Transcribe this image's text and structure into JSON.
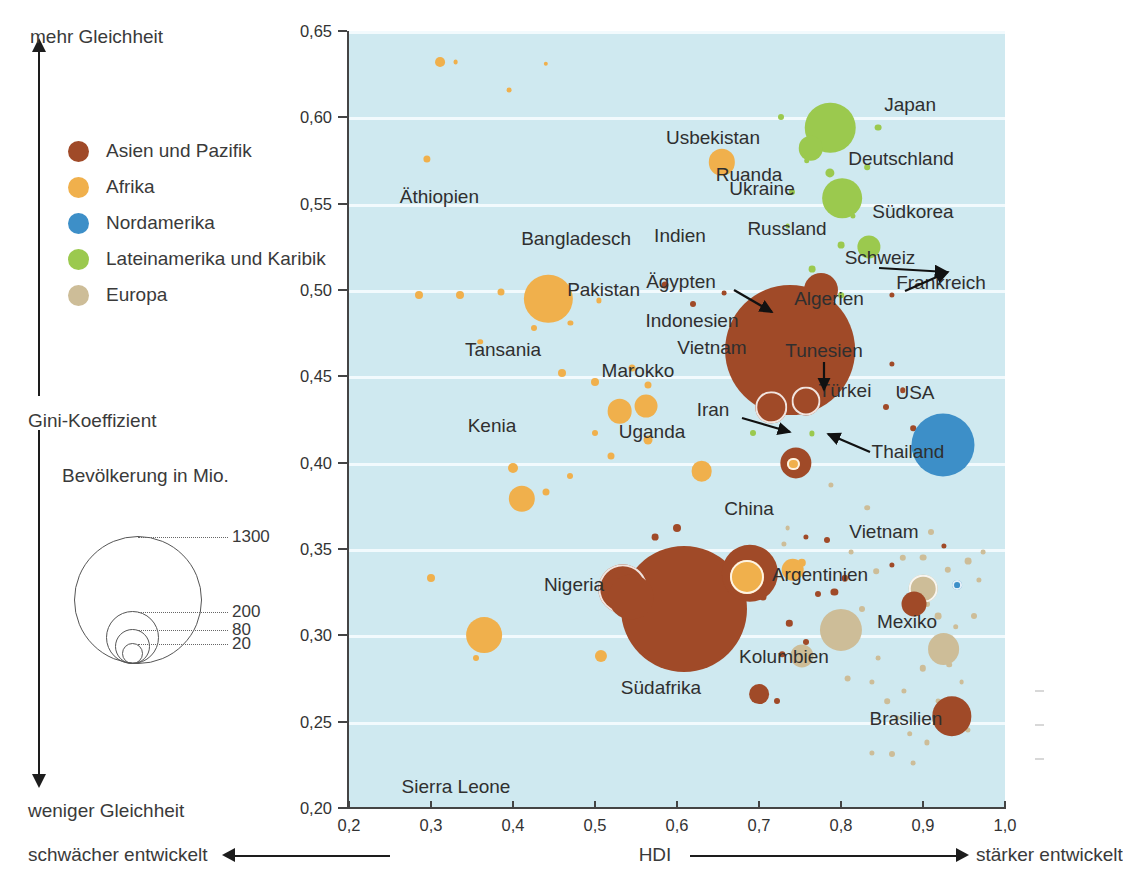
{
  "chart_data": {
    "type": "scatter",
    "subtype": "bubble",
    "title": "",
    "xlabel": "HDI",
    "ylabel": "Gini-Koeffizient",
    "xlim": [
      0.2,
      1.0
    ],
    "ylim": [
      0.65,
      0.2
    ],
    "y_inverted": true,
    "grid": "horizontal",
    "xticks": [
      "0,2",
      "0,3",
      "0,4",
      "0,5",
      "0,6",
      "0,7",
      "0,8",
      "0,9",
      "1,0"
    ],
    "xtick_values": [
      0.2,
      0.3,
      0.4,
      0.5,
      0.6,
      0.7,
      0.8,
      0.9,
      1.0
    ],
    "yticks": [
      "0,20",
      "0,25",
      "0,30",
      "0,35",
      "0,40",
      "0,45",
      "0,50",
      "0,55",
      "0,60",
      "0,65"
    ],
    "ytick_values": [
      0.2,
      0.25,
      0.3,
      0.35,
      0.4,
      0.45,
      0.5,
      0.55,
      0.6,
      0.65
    ],
    "size_encoding": "Bevölkerung in Mio.",
    "legend_position": "left",
    "plot_background": "#cfe9f0",
    "series": [
      {
        "name": "Asien und Pazifik",
        "color": "#a04a28"
      },
      {
        "name": "Afrika",
        "color": "#f0b04c"
      },
      {
        "name": "Nordamerika",
        "color": "#3d8fc8"
      },
      {
        "name": "Lateinamerika und Karibik",
        "color": "#9bc94e"
      },
      {
        "name": "Europa",
        "color": "#cdbd98"
      }
    ],
    "points": [
      {
        "name": "Indien",
        "group": 0,
        "hdi": 0.609,
        "gini": 0.315,
        "pop": 1300
      },
      {
        "name": "China",
        "group": 0,
        "hdi": 0.738,
        "gini": 0.465,
        "pop": 1380
      },
      {
        "name": "Bangladesch",
        "group": 0,
        "hdi": 0.544,
        "gini": 0.322,
        "pop": 165
      },
      {
        "name": "Pakistan",
        "group": 0,
        "hdi": 0.534,
        "gini": 0.327,
        "pop": 200
      },
      {
        "name": "Indonesien",
        "group": 0,
        "hdi": 0.689,
        "gini": 0.336,
        "pop": 260
      },
      {
        "name": "Japan",
        "group": 0,
        "hdi": 0.935,
        "gini": 0.253,
        "pop": 127
      },
      {
        "name": "Vietnam",
        "group": 0,
        "hdi": 0.775,
        "gini": 0.5,
        "pop": 95
      },
      {
        "name": "Ägypten",
        "group": 1,
        "hdi": 0.685,
        "gini": 0.334,
        "pop": 95
      },
      {
        "name": "Usbekistan",
        "group": 0,
        "hdi": 0.7,
        "gini": 0.266,
        "pop": 32
      },
      {
        "name": "Russland",
        "group": 4,
        "hdi": 0.8,
        "gini": 0.303,
        "pop": 145
      },
      {
        "name": "Ukraine",
        "group": 4,
        "hdi": 0.752,
        "gini": 0.288,
        "pop": 44
      },
      {
        "name": "Deutschland",
        "group": 4,
        "hdi": 0.925,
        "gini": 0.292,
        "pop": 83
      },
      {
        "name": "Südkorea",
        "group": 0,
        "hdi": 0.889,
        "gini": 0.318,
        "pop": 51
      },
      {
        "name": "Schweiz",
        "group": 2,
        "hdi": 0.942,
        "gini": 0.329,
        "pop": 8
      },
      {
        "name": "Frankreich",
        "group": 4,
        "hdi": 0.9,
        "gini": 0.327,
        "pop": 67
      },
      {
        "name": "Algerien",
        "group": 1,
        "hdi": 0.741,
        "gini": 0.338,
        "pop": 42
      },
      {
        "name": "Tunesien",
        "group": 1,
        "hdi": 0.742,
        "gini": 0.399,
        "pop": 12
      },
      {
        "name": "Türkei",
        "group": 0,
        "hdi": 0.745,
        "gini": 0.4,
        "pop": 80
      },
      {
        "name": "USA",
        "group": 2,
        "hdi": 0.924,
        "gini": 0.41,
        "pop": 325
      },
      {
        "name": "Iran",
        "group": 0,
        "hdi": 0.715,
        "gini": 0.432,
        "pop": 81
      },
      {
        "name": "Thailand",
        "group": 0,
        "hdi": 0.757,
        "gini": 0.436,
        "pop": 69
      },
      {
        "name": "Äthiopien",
        "group": 1,
        "hdi": 0.365,
        "gini": 0.3,
        "pop": 105
      },
      {
        "name": "Ruanda",
        "group": 1,
        "hdi": 0.507,
        "gini": 0.288,
        "pop": 12
      },
      {
        "name": "Tansania",
        "group": 1,
        "hdi": 0.411,
        "gini": 0.379,
        "pop": 57
      },
      {
        "name": "Marokko",
        "group": 1,
        "hdi": 0.63,
        "gini": 0.395,
        "pop": 35
      },
      {
        "name": "Kenia",
        "group": 1,
        "hdi": 0.53,
        "gini": 0.43,
        "pop": 50
      },
      {
        "name": "Uganda",
        "group": 1,
        "hdi": 0.562,
        "gini": 0.433,
        "pop": 43
      },
      {
        "name": "Nigeria",
        "group": 1,
        "hdi": 0.443,
        "gini": 0.495,
        "pop": 191
      },
      {
        "name": "Südafrika",
        "group": 1,
        "hdi": 0.655,
        "gini": 0.574,
        "pop": 57
      },
      {
        "name": "Sierra Leone",
        "group": 1,
        "hdi": 0.311,
        "gini": 0.632,
        "pop": 8
      },
      {
        "name": "Mexiko",
        "group": 3,
        "hdi": 0.801,
        "gini": 0.553,
        "pop": 129
      },
      {
        "name": "Brasilien",
        "group": 3,
        "hdi": 0.787,
        "gini": 0.594,
        "pop": 209
      },
      {
        "name": "Argentinien",
        "group": 3,
        "hdi": 0.834,
        "gini": 0.525,
        "pop": 44
      },
      {
        "name": "Kolumbien",
        "group": 3,
        "hdi": 0.763,
        "gini": 0.582,
        "pop": 49
      }
    ]
  },
  "axes": {
    "y_top_label": "mehr Gleichheit",
    "y_bottom_label": "weniger Gleichheit",
    "y_mid_label": "Gini-Koeffizient",
    "x_left_label": "schwächer entwickelt",
    "x_center_label": "HDI",
    "x_right_label": "stärker entwickelt"
  },
  "category_legend": {
    "items": [
      {
        "label": "Asien und Pazifik",
        "color": "#a04a28"
      },
      {
        "label": "Afrika",
        "color": "#f0b04c"
      },
      {
        "label": "Nordamerika",
        "color": "#3d8fc8"
      },
      {
        "label": "Lateinamerika und Karibik",
        "color": "#9bc94e"
      },
      {
        "label": "Europa",
        "color": "#cdbd98"
      }
    ]
  },
  "size_legend": {
    "title": "Bevölkerung in Mio.",
    "values": [
      "1300",
      "200",
      "80",
      "20"
    ]
  },
  "country_labels": [
    {
      "text": "Japan",
      "x": 936,
      "y": 104,
      "align": "r"
    },
    {
      "text": "Usbekistan",
      "x": 713,
      "y": 137,
      "align": "c"
    },
    {
      "text": "Deutschland",
      "x": 901,
      "y": 158,
      "align": "c"
    },
    {
      "text": "Ruanda",
      "x": 749,
      "y": 174,
      "align": "c"
    },
    {
      "text": "Ukraine",
      "x": 762,
      "y": 188,
      "align": "c"
    },
    {
      "text": "Äthiopien",
      "x": 479,
      "y": 196,
      "align": "r"
    },
    {
      "text": "Südkorea",
      "x": 913,
      "y": 211,
      "align": "c"
    },
    {
      "text": "Russland",
      "x": 787,
      "y": 228,
      "align": "c"
    },
    {
      "text": "Indien",
      "x": 680,
      "y": 235,
      "align": "c"
    },
    {
      "text": "Bangladesch",
      "x": 631,
      "y": 238,
      "align": "r"
    },
    {
      "text": "Schweiz",
      "x": 880,
      "y": 257,
      "align": "c"
    },
    {
      "text": "Ägypten",
      "x": 681,
      "y": 281,
      "align": "c"
    },
    {
      "text": "Frankreich",
      "x": 941,
      "y": 282,
      "align": "c"
    },
    {
      "text": "Pakistan",
      "x": 640,
      "y": 289,
      "align": "r"
    },
    {
      "text": "Algerien",
      "x": 829,
      "y": 298,
      "align": "c"
    },
    {
      "text": "Indonesien",
      "x": 692,
      "y": 320,
      "align": "c"
    },
    {
      "text": "Vietnam",
      "x": 712,
      "y": 347,
      "align": "c"
    },
    {
      "text": "Tansania",
      "x": 503,
      "y": 349,
      "align": "c"
    },
    {
      "text": "Tunesien",
      "x": 824,
      "y": 350,
      "align": "c"
    },
    {
      "text": "Marokko",
      "x": 638,
      "y": 370,
      "align": "c"
    },
    {
      "text": "Türkei",
      "x": 845,
      "y": 390,
      "align": "c"
    },
    {
      "text": "USA",
      "x": 915,
      "y": 392,
      "align": "c"
    },
    {
      "text": "Iran",
      "x": 713,
      "y": 409,
      "align": "c"
    },
    {
      "text": "Kenia",
      "x": 492,
      "y": 425,
      "align": "c"
    },
    {
      "text": "Uganda",
      "x": 652,
      "y": 431,
      "align": "c"
    },
    {
      "text": "Thailand",
      "x": 908,
      "y": 451,
      "align": "c"
    },
    {
      "text": "China",
      "x": 749,
      "y": 508,
      "align": "c"
    },
    {
      "text": "Vietnam",
      "x": 884,
      "y": 531,
      "align": "c"
    },
    {
      "text": "Nigeria",
      "x": 574,
      "y": 584,
      "align": "c"
    },
    {
      "text": "Argentinien",
      "x": 820,
      "y": 574,
      "align": "c"
    },
    {
      "text": "Mexiko",
      "x": 907,
      "y": 621,
      "align": "c"
    },
    {
      "text": "Kolumbien",
      "x": 784,
      "y": 656,
      "align": "c"
    },
    {
      "text": "Südafrika",
      "x": 661,
      "y": 687,
      "align": "c"
    },
    {
      "text": "Brasilien",
      "x": 906,
      "y": 718,
      "align": "c"
    },
    {
      "text": "Sierra Leone",
      "x": 456,
      "y": 786,
      "align": "c"
    }
  ]
}
